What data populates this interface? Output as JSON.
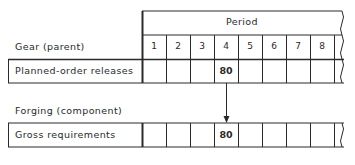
{
  "header": {
    "period_label": "Period",
    "periods": [
      "1",
      "2",
      "3",
      "4",
      "5",
      "6",
      "7",
      "8"
    ]
  },
  "parent": {
    "section_label": "Gear (parent)",
    "row_label": "Planned-order releases",
    "values": [
      "",
      "",
      "",
      "80",
      "",
      "",
      "",
      ""
    ]
  },
  "component": {
    "section_label": "Forging (component)",
    "row_label": "Gross requirements",
    "values": [
      "",
      "",
      "",
      "80",
      "",
      "",
      "",
      ""
    ]
  },
  "arrow": {
    "from_period": "4",
    "to_period": "4"
  },
  "colors": {
    "line": "#2a2a2a",
    "background": "#ffffff"
  }
}
